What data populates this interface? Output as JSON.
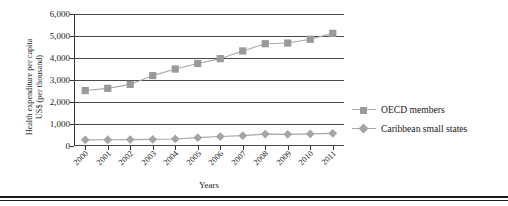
{
  "chart_data": {
    "type": "line",
    "title": "",
    "xlabel": "Years",
    "ylabel": "Health expenditure per capita US$ (per thousand)",
    "ylabel_line1": "Health expenditure per capita",
    "ylabel_line2": "US$ (per thousand)",
    "categories": [
      "2000",
      "2001",
      "2002",
      "2003",
      "2004",
      "2005",
      "2006",
      "2007",
      "2008",
      "2009",
      "2010",
      "2011"
    ],
    "ylim": [
      0,
      6000
    ],
    "yticks": [
      "0",
      "1,000",
      "2,000",
      "3,000",
      "4,000",
      "5,000",
      "6,000"
    ],
    "ytick_values": [
      0,
      1000,
      2000,
      3000,
      4000,
      5000,
      6000
    ],
    "grid": true,
    "legend_position": "right",
    "series": [
      {
        "name": "OECD members",
        "marker": "square",
        "color": "#9a9a9a",
        "values": [
          2520,
          2620,
          2800,
          3200,
          3500,
          3750,
          3970,
          4320,
          4650,
          4680,
          4850,
          5120
        ]
      },
      {
        "name": "Caribbean small states",
        "marker": "diamond",
        "color": "#a5a5a5",
        "values": [
          280,
          285,
          290,
          300,
          320,
          380,
          430,
          470,
          540,
          530,
          550,
          575
        ]
      }
    ]
  },
  "legend": {
    "items": [
      {
        "label": "OECD members"
      },
      {
        "label": "Caribbean small states"
      }
    ]
  },
  "axes": {
    "x_title": "Years",
    "y_title_line1": "Health expenditure per capita",
    "y_title_line2": "US$ (per thousand)"
  },
  "colors": {
    "series_1": "#9a9a9a",
    "series_2": "#a5a5a5",
    "line": "#a8a8a8",
    "grid": "#4a4a4a",
    "text": "#1a1a1a"
  }
}
